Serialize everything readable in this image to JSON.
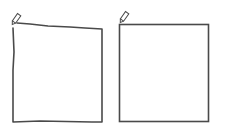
{
  "canvas": {
    "width": 225,
    "height": 130,
    "background": "#ffffff"
  },
  "stroke_color": "#4a4a4a",
  "shapes": [
    {
      "id": "hand-drawn-square",
      "style": "freehand",
      "icon": "pencil-icon"
    },
    {
      "id": "rectangle-square",
      "style": "precise",
      "icon": "pencil-icon"
    }
  ]
}
